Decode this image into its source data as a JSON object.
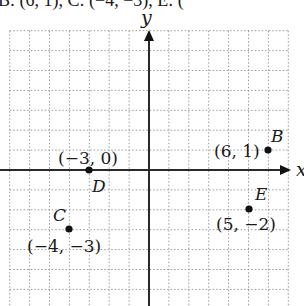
{
  "header": {
    "cut_off_text": "B: (6, 1), C: (−4, −3), E: ("
  },
  "graph": {
    "axes": {
      "x_label": "x",
      "y_label": "y"
    },
    "grid": {
      "x_range": [
        -7,
        7
      ],
      "y_range": [
        -7,
        7
      ],
      "visible_y_min": -6.8,
      "spacing_px": 19.9,
      "origin_px": [
        149,
        170
      ],
      "line_style": "dotted",
      "line_color": "#9a9a9a"
    },
    "colors": {
      "axis": "#2a2a2a",
      "point": "#111111",
      "text": "#1a1a1a"
    },
    "points": [
      {
        "name": "B",
        "x": 6,
        "y": 1,
        "coord_label": "(6, 1)"
      },
      {
        "name": "C",
        "x": -4,
        "y": -3,
        "coord_label": "(−4, −3)"
      },
      {
        "name": "D",
        "x": -3,
        "y": 0,
        "coord_label": "(−3, 0)"
      },
      {
        "name": "E",
        "x": 5,
        "y": -2,
        "coord_label": "(5, −2)"
      }
    ]
  }
}
